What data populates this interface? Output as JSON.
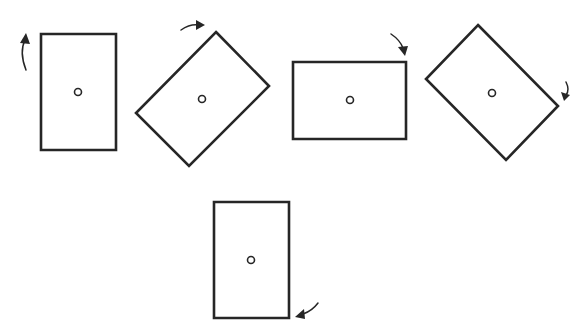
{
  "figure": {
    "stroke_color": "#262626",
    "background": "#ffffff",
    "states": [
      {
        "id": "state-1",
        "orientation": "portrait",
        "angle_deg": 0,
        "points": "41,34 116,34 116,150 41,150",
        "pivot": {
          "cx": 78,
          "cy": 92,
          "r": 3.5
        },
        "arrow": {
          "direction": "counter-clockwise",
          "position": "left-top",
          "path": "M26,70 Q19,52 25,40",
          "head": "20,43 26,33 30,44"
        }
      },
      {
        "id": "state-2",
        "orientation": "tilted",
        "angle_deg": 45,
        "points": "216,32 269,86 189,166 136,113",
        "pivot": {
          "cx": 202,
          "cy": 99,
          "r": 3.5
        },
        "arrow": {
          "direction": "clockwise",
          "position": "top",
          "path": "M181,30 Q190,24 198,25",
          "head": "196,20 205,25 196,30"
        }
      },
      {
        "id": "state-3",
        "orientation": "landscape",
        "angle_deg": 90,
        "points": "293,62 406,62 406,139 293,139",
        "pivot": {
          "cx": 350,
          "cy": 100,
          "r": 3.5
        },
        "arrow": {
          "direction": "clockwise",
          "position": "top-right",
          "path": "M391,34 Q400,40 403,48",
          "head": "398,47 405,56 408,46"
        }
      },
      {
        "id": "state-4",
        "orientation": "tilted",
        "angle_deg": 135,
        "points": "478,25 558,106 506,160 426,79",
        "pivot": {
          "cx": 492,
          "cy": 93,
          "r": 3.5
        },
        "arrow": {
          "direction": "clockwise",
          "position": "right",
          "path": "M566,82 Q570,90 566,95",
          "head": "561,92 564,101 570,95"
        }
      },
      {
        "id": "state-5",
        "orientation": "portrait",
        "angle_deg": 180,
        "points": "214,202 289,202 289,318 214,318",
        "pivot": {
          "cx": 251,
          "cy": 260,
          "r": 3.5
        },
        "arrow": {
          "direction": "clockwise",
          "position": "bottom-right",
          "path": "M318,303 Q312,311 303,314",
          "head": "304,309 295,317 305,319"
        }
      }
    ]
  }
}
